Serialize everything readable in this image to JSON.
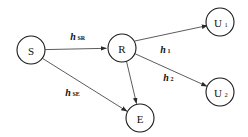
{
  "diagram": {
    "type": "relay-network-graph",
    "background_color": "#ffffff",
    "node_stroke_color": "#1a1a1a",
    "edge_color": "#4a4a4a",
    "text_color": "#111111",
    "nodes": [
      {
        "id": "S",
        "label": "S",
        "subscript": "",
        "cx": 31,
        "cy": 50,
        "r": 14
      },
      {
        "id": "R",
        "label": "R",
        "subscript": "",
        "cx": 122,
        "cy": 48,
        "r": 14
      },
      {
        "id": "U1",
        "label": "U",
        "subscript": "1",
        "cx": 220,
        "cy": 22,
        "r": 14
      },
      {
        "id": "U2",
        "label": "U",
        "subscript": "2",
        "cx": 220,
        "cy": 92,
        "r": 14
      },
      {
        "id": "E",
        "label": "E",
        "subscript": "",
        "cx": 140,
        "cy": 118,
        "r": 14
      }
    ],
    "edges": [
      {
        "id": "S-R",
        "from": "S",
        "to": "R",
        "label": "h",
        "subscript": "SR",
        "label_x": 76,
        "label_y": 36
      },
      {
        "id": "S-E",
        "from": "S",
        "to": "E",
        "label": "h",
        "subscript": "SE",
        "label_x": 71,
        "label_y": 92
      },
      {
        "id": "R-U1",
        "from": "R",
        "to": "U1",
        "label": "h",
        "subscript": "1",
        "label_x": 165,
        "label_y": 49
      },
      {
        "id": "R-U2",
        "from": "R",
        "to": "U2",
        "label": "h",
        "subscript": "2",
        "label_x": 168,
        "label_y": 77
      },
      {
        "id": "R-E",
        "from": "R",
        "to": "E",
        "label": "",
        "subscript": "",
        "label_x": 0,
        "label_y": 0
      }
    ]
  }
}
